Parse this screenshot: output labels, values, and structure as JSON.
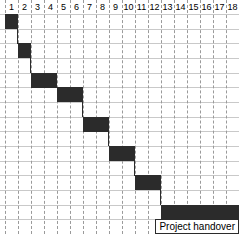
{
  "chart_data": {
    "type": "bar",
    "title": "",
    "xlabel": "",
    "ylabel": "",
    "orientation": "horizontal",
    "chart_kind": "gantt",
    "grid": true,
    "legend": "none",
    "columns": [
      "1",
      "2",
      "3",
      "4",
      "5",
      "6",
      "7",
      "8",
      "9",
      "10",
      "11",
      "12",
      "13",
      "14",
      "15",
      "16",
      "17",
      "18"
    ],
    "xlim": [
      1,
      19
    ],
    "row_count": 15,
    "categories": [
      "task-1",
      "task-2",
      "task-3",
      "task-4",
      "task-5",
      "task-6",
      "task-7",
      "task-8"
    ],
    "tasks": [
      {
        "name": "task-1",
        "row": 0,
        "start": 1,
        "end": 2,
        "label": ""
      },
      {
        "name": "task-2",
        "row": 2,
        "start": 2,
        "end": 3,
        "label": ""
      },
      {
        "name": "task-3",
        "row": 4,
        "start": 3,
        "end": 5,
        "label": ""
      },
      {
        "name": "task-4",
        "row": 5,
        "start": 5,
        "end": 7,
        "label": ""
      },
      {
        "name": "task-5",
        "row": 7,
        "start": 7,
        "end": 9,
        "label": ""
      },
      {
        "name": "task-6",
        "row": 9,
        "start": 9,
        "end": 11,
        "label": ""
      },
      {
        "name": "task-7",
        "row": 11,
        "start": 11,
        "end": 13,
        "label": ""
      },
      {
        "name": "task-8",
        "row": 13,
        "start": 13,
        "end": 19,
        "label": "Project handover"
      }
    ],
    "bar_color": "#2b2b2b",
    "grid_color": "#c9c9c9",
    "column_separator_color": "#9a9a9a",
    "background_color": "#ffffff"
  },
  "header": {
    "cells": [
      "1",
      "2",
      "3",
      "4",
      "5",
      "6",
      "7",
      "8",
      "9",
      "10",
      "11",
      "12",
      "13",
      "14",
      "15",
      "16",
      "17",
      "18"
    ]
  },
  "labels": {
    "milestone": "Project handover"
  }
}
